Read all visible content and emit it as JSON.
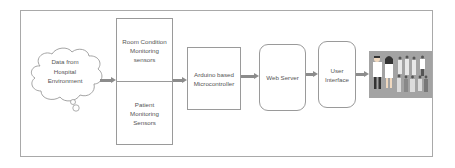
{
  "diagram": {
    "source": {
      "label_lines": [
        "Data from",
        "Hospital",
        "Environment"
      ],
      "shape": "cloud"
    },
    "sensors": {
      "top": {
        "label_lines": [
          "Room Condition",
          "Monitoring",
          "sensors"
        ]
      },
      "bottom": {
        "label_lines": [
          "Patient",
          "Monitoring",
          "Sensors"
        ]
      }
    },
    "controller": {
      "label_lines": [
        "Arduino based",
        "Microcontroller"
      ]
    },
    "server": {
      "label": "Web Server"
    },
    "ui": {
      "label_lines": [
        "User",
        "Interface"
      ]
    },
    "users": {
      "icon": "medical-staff-people-icon",
      "background": "#a3a3a3"
    },
    "flow": [
      "Data from Hospital Environment",
      "Sensors",
      "Arduino based Microcontroller",
      "Web Server",
      "User Interface",
      "Users"
    ],
    "colors": {
      "arrow": "#8c8c8c",
      "border": "#9a9a9a",
      "text": "#555555"
    }
  }
}
